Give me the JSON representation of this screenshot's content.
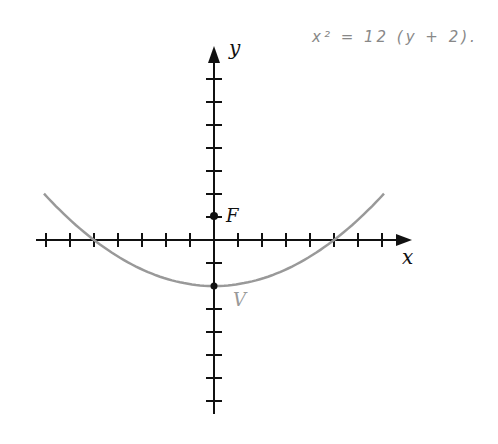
{
  "annotation": {
    "text": "x² = 12 (y + 2)."
  },
  "axes": {
    "x_label": "x",
    "y_label": "y",
    "origin_px": [
      214,
      240
    ],
    "tick_spacing_x_px": 24,
    "tick_spacing_y_px": 23,
    "x_ticks": [
      -7,
      -6,
      -5,
      -4,
      -3,
      -2,
      -1,
      1,
      2,
      3,
      4,
      5,
      6,
      7
    ],
    "y_ticks": [
      -7,
      -6,
      -5,
      -4,
      -3,
      -2,
      -1,
      1,
      2,
      3,
      4,
      5,
      6,
      7
    ]
  },
  "points": {
    "focus": {
      "label": "F",
      "x": 0,
      "y": 1
    },
    "vertex": {
      "label": "V",
      "x": 0,
      "y": -2
    }
  },
  "curve": {
    "name": "parabola",
    "color": "#999999",
    "x_intercepts": [
      -5,
      5
    ]
  },
  "colors": {
    "axis": "#111111",
    "curve": "#999999",
    "vertex_label": "#999999"
  }
}
